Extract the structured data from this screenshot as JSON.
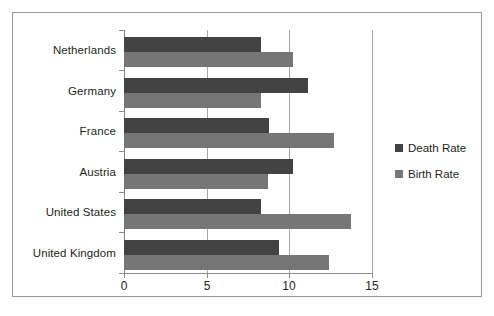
{
  "chart_data": {
    "type": "bar",
    "orientation": "horizontal",
    "title": "",
    "subtitle": "",
    "xlabel": "",
    "ylabel": "",
    "categories": [
      "Netherlands",
      "Germany",
      "France",
      "Austria",
      "United States",
      "United Kingdom"
    ],
    "series": [
      {
        "name": "Death Rate",
        "color": "#434343",
        "values": [
          8.3,
          11.1,
          8.8,
          10.2,
          8.3,
          9.4
        ]
      },
      {
        "name": "Birth Rate",
        "color": "#767676",
        "values": [
          10.2,
          8.3,
          12.7,
          8.7,
          13.7,
          12.4
        ]
      }
    ],
    "xlim": [
      0,
      15
    ],
    "xticks": [
      0,
      5,
      10,
      15
    ],
    "xtick_labels": [
      "0",
      "5",
      "10",
      "15"
    ],
    "grid": true,
    "grid_axis": "x",
    "legend_position": "right",
    "legend": [
      "Death Rate",
      "Birth Rate"
    ],
    "frame_border_color": "#9a9a9a",
    "background_color": "#ffffff"
  }
}
